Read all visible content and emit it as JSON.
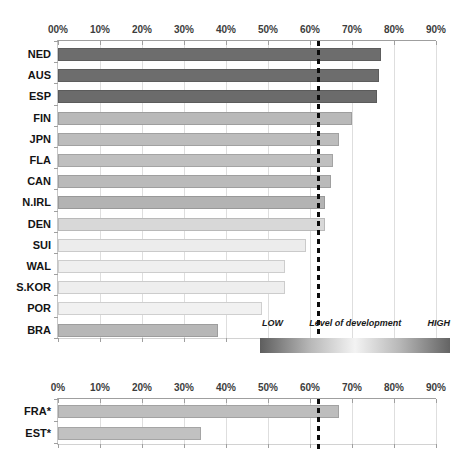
{
  "chart_data": [
    {
      "type": "bar",
      "orientation": "horizontal",
      "title": "",
      "categories": [
        "NED",
        "AUS",
        "ESP",
        "FIN",
        "JPN",
        "FLA",
        "CAN",
        "N.IRL",
        "DEN",
        "SUI",
        "WAL",
        "S.KOR",
        "POR",
        "BRA"
      ],
      "values": [
        77,
        76.5,
        76,
        70,
        67,
        65.5,
        65,
        63.5,
        63.5,
        59,
        54,
        54,
        48.5,
        38
      ],
      "bar_colors": [
        "#6d6d6d",
        "#6d6d6d",
        "#6b6b6b",
        "#b9b9b9",
        "#bcbcbc",
        "#bfbfbf",
        "#bababa",
        "#b3b3b3",
        "#d8d8d8",
        "#ececec",
        "#efefef",
        "#eeeeee",
        "#f1f1f1",
        "#b7b7b7"
      ],
      "x_tick_labels": [
        "00%",
        "10%",
        "20%",
        "30%",
        "40%",
        "50%",
        "60%",
        "70%",
        "80%",
        "90%"
      ],
      "xlim": [
        0,
        90
      ],
      "grid": true,
      "reference_line": 62,
      "legend": {
        "low": "LOW",
        "title": "Level of development",
        "high": "HIGH",
        "gradient": [
          "#5e5e5e",
          "#f3f3f3",
          "#646464"
        ],
        "position": "bottom-right"
      }
    },
    {
      "type": "bar",
      "orientation": "horizontal",
      "title": "",
      "categories": [
        "FRA*",
        "EST*"
      ],
      "values": [
        67,
        34
      ],
      "bar_colors": [
        "#bdbdbd",
        "#c1c1c1"
      ],
      "x_tick_labels": [
        "0%",
        "10%",
        "20%",
        "30%",
        "40%",
        "50%",
        "60%",
        "70%",
        "80%",
        "90%"
      ],
      "xlim": [
        0,
        90
      ],
      "grid": true,
      "reference_line": 62
    }
  ]
}
